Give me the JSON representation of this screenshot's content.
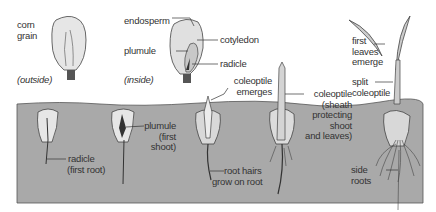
{
  "diagram": {
    "colors": {
      "soil": "#a9a9a9",
      "seed": "#e6e6e6",
      "line": "#333333",
      "background": "#ffffff"
    },
    "grain_labels": {
      "corn_grain": [
        "corn",
        "grain"
      ],
      "outside": "(outside)",
      "inside": "(inside)",
      "endosperm": "endosperm",
      "plumule": "plumule",
      "cotyledon": "cotyledon",
      "radicle": "radicle"
    },
    "stages": [
      {
        "label": [
          "radicle",
          "(first root)"
        ]
      },
      {
        "label": [
          "plumule",
          "(first",
          "shoot)"
        ]
      },
      {
        "label_above": [
          "coleoptile",
          "emerges"
        ],
        "label_below": [
          "root hairs",
          "grow on root"
        ]
      },
      {
        "label": [
          "coleoptile",
          "(sheath",
          "protecting",
          "shoot",
          "and leaves)"
        ]
      },
      {
        "label_top": [
          "first",
          "leaves",
          "emerge"
        ],
        "label_mid": [
          "split",
          "coleoptile"
        ],
        "label_bottom": [
          "side",
          "roots"
        ]
      }
    ]
  }
}
